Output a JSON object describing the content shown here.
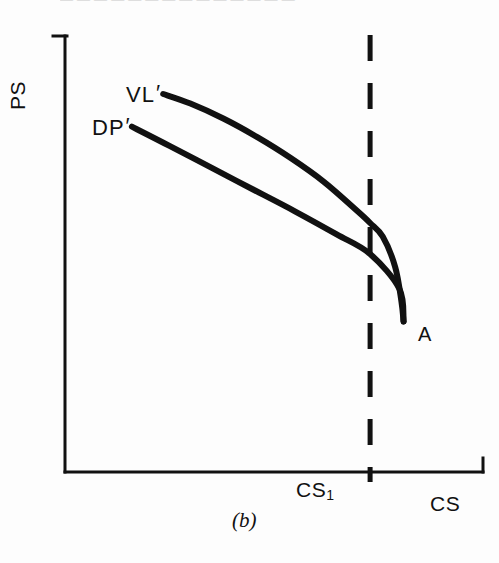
{
  "figure": {
    "caption": "(b)",
    "top_cropped_header": "— — — — — — — — — — — — — —",
    "ink_color": "#111111",
    "background_color": "#fdfdfd"
  },
  "axes": {
    "y_label": "PS",
    "x_label": "CS",
    "x_tick_label": "CS",
    "x_tick_subscript": "1"
  },
  "annotations": {
    "upper_curve_label": "VL",
    "upper_curve_prime": "′",
    "lower_curve_label": "DP",
    "lower_curve_prime": "′",
    "intersection_point_label": "A"
  },
  "chart_data": {
    "type": "line",
    "title": "(b)",
    "xlabel": "CS",
    "ylabel": "PS",
    "grid": false,
    "legend": "inline-curve-labels",
    "xlim": [
      0,
      1
    ],
    "ylim": [
      0,
      1
    ],
    "axis_ticks": {
      "x": [
        {
          "value": 0.73,
          "label": "CS₁"
        }
      ],
      "y": []
    },
    "annotations": [
      {
        "label": "VL′",
        "x": 0.29,
        "y": 0.82,
        "note": "label for upper (vertical-linkage) curve"
      },
      {
        "label": "DP′",
        "x": 0.16,
        "y": 0.75,
        "note": "label for lower (downstream-pricing) curve"
      },
      {
        "label": "A",
        "x": 0.8,
        "y": 0.345,
        "note": "common endpoint where both curves meet"
      },
      {
        "label": "CS₁",
        "x": 0.73,
        "y": -0.04,
        "note": "tick on CS axis at the dashed reference line"
      }
    ],
    "reference_lines": [
      {
        "orientation": "vertical",
        "x": 0.73,
        "style": "dashed",
        "label": "CS₁",
        "width": 4
      }
    ],
    "series": [
      {
        "name": "VL′",
        "style": "solid",
        "points": [
          {
            "x": 0.235,
            "y": 0.867
          },
          {
            "x": 0.3,
            "y": 0.845
          },
          {
            "x": 0.38,
            "y": 0.81
          },
          {
            "x": 0.46,
            "y": 0.768
          },
          {
            "x": 0.54,
            "y": 0.72
          },
          {
            "x": 0.62,
            "y": 0.665
          },
          {
            "x": 0.7,
            "y": 0.598
          },
          {
            "x": 0.73,
            "y": 0.571
          },
          {
            "x": 0.76,
            "y": 0.54
          },
          {
            "x": 0.79,
            "y": 0.47
          },
          {
            "x": 0.805,
            "y": 0.39
          },
          {
            "x": 0.81,
            "y": 0.345
          }
        ]
      },
      {
        "name": "DP′",
        "style": "solid",
        "points": [
          {
            "x": 0.16,
            "y": 0.792
          },
          {
            "x": 0.25,
            "y": 0.748
          },
          {
            "x": 0.35,
            "y": 0.698
          },
          {
            "x": 0.45,
            "y": 0.648
          },
          {
            "x": 0.55,
            "y": 0.598
          },
          {
            "x": 0.65,
            "y": 0.545
          },
          {
            "x": 0.73,
            "y": 0.5
          },
          {
            "x": 0.8,
            "y": 0.42
          },
          {
            "x": 0.81,
            "y": 0.345
          }
        ]
      }
    ]
  }
}
